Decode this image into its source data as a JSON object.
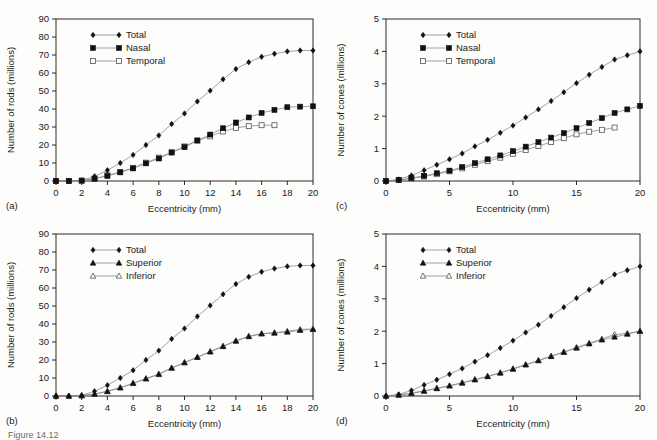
{
  "figure": {
    "background_color": "#fdfdfb",
    "ink_color": "#111111",
    "line_color": "#8a8a8a",
    "caption_partial": "Figure 14.12"
  },
  "labels": {
    "panel_a": "(a)",
    "panel_b": "(b)",
    "panel_c": "(c)",
    "panel_d": "(d)",
    "xlabel": "Eccentricity (mm)",
    "ylabel_rods": "Number of rods (millions)",
    "ylabel_cones": "Number of cones (millions)"
  },
  "chart_data": [
    {
      "id": "panel-a",
      "panel": "(a)",
      "type": "line",
      "title": "",
      "xlabel": "Eccentricity (mm)",
      "ylabel": "Number of rods (millions)",
      "xlim": [
        0,
        20
      ],
      "ylim": [
        0,
        90
      ],
      "xticks": [
        0,
        2,
        4,
        6,
        8,
        10,
        12,
        14,
        16,
        18,
        20
      ],
      "yticks": [
        0,
        10,
        20,
        30,
        40,
        50,
        60,
        70,
        80,
        90
      ],
      "grid": false,
      "legend_position": "upper-left",
      "series": [
        {
          "name": "Total",
          "marker": "filled-diamond",
          "x": [
            0,
            1,
            2,
            3,
            4,
            5,
            6,
            7,
            8,
            9,
            10,
            11,
            12,
            13,
            14,
            15,
            16,
            17,
            18,
            19,
            20
          ],
          "values": [
            0,
            0,
            0.3,
            2.6,
            6.0,
            10.0,
            14.5,
            20.0,
            25.3,
            31.7,
            37.5,
            44.2,
            50.2,
            56.5,
            62.2,
            66.0,
            69.0,
            70.7,
            72.0,
            72.5,
            72.5
          ]
        },
        {
          "name": "Nasal",
          "marker": "filled-square",
          "x": [
            0,
            1,
            2,
            3,
            4,
            5,
            6,
            7,
            8,
            9,
            10,
            11,
            12,
            13,
            14,
            15,
            16,
            17,
            18,
            19,
            20
          ],
          "values": [
            0,
            0,
            0.2,
            1.3,
            2.8,
            4.8,
            7.0,
            9.8,
            12.5,
            15.8,
            18.8,
            22.5,
            25.8,
            29.3,
            32.5,
            35.3,
            37.8,
            39.5,
            41.0,
            41.3,
            41.5
          ]
        },
        {
          "name": "Temporal",
          "marker": "open-square",
          "x": [
            0,
            1,
            2,
            3,
            4,
            5,
            6,
            7,
            8,
            9,
            10,
            11,
            12,
            13,
            14,
            15,
            16,
            17
          ],
          "values": [
            0,
            0,
            0.2,
            1.2,
            3.2,
            5.0,
            7.3,
            10.2,
            13.0,
            16.0,
            19.2,
            22.5,
            24.8,
            27.5,
            29.5,
            30.5,
            31.0,
            31.0
          ]
        }
      ]
    },
    {
      "id": "panel-b",
      "panel": "(b)",
      "type": "line",
      "title": "",
      "xlabel": "Eccentricity (mm)",
      "ylabel": "Number of rods (millions)",
      "xlim": [
        0,
        20
      ],
      "ylim": [
        0,
        90
      ],
      "xticks": [
        0,
        2,
        4,
        6,
        8,
        10,
        12,
        14,
        16,
        18,
        20
      ],
      "yticks": [
        0,
        10,
        20,
        30,
        40,
        50,
        60,
        70,
        80,
        90
      ],
      "grid": false,
      "legend_position": "upper-left",
      "series": [
        {
          "name": "Total",
          "marker": "filled-diamond",
          "x": [
            0,
            1,
            2,
            3,
            4,
            5,
            6,
            7,
            8,
            9,
            10,
            11,
            12,
            13,
            14,
            15,
            16,
            17,
            18,
            19,
            20
          ],
          "values": [
            0,
            0,
            0.3,
            2.6,
            6.0,
            10.0,
            14.3,
            20.0,
            25.2,
            31.7,
            37.5,
            44.2,
            50.3,
            56.5,
            62.2,
            66.2,
            69.0,
            70.8,
            72.0,
            72.5,
            72.5
          ]
        },
        {
          "name": "Superior",
          "marker": "filled-triangle",
          "x": [
            0,
            1,
            2,
            3,
            4,
            5,
            6,
            7,
            8,
            9,
            10,
            11,
            12,
            13,
            14,
            15,
            16,
            17,
            18,
            19,
            20
          ],
          "values": [
            0,
            0,
            0.2,
            1.0,
            2.5,
            4.5,
            7.0,
            9.5,
            12.0,
            15.5,
            18.5,
            21.5,
            24.5,
            27.5,
            30.5,
            33.0,
            34.5,
            35.0,
            35.5,
            36.5,
            37.0
          ]
        },
        {
          "name": "Inferior",
          "marker": "open-triangle",
          "x": [
            0,
            1,
            2,
            3,
            4,
            5,
            6,
            7,
            8,
            9,
            10,
            11,
            12,
            13,
            14,
            15,
            16,
            17,
            18,
            19,
            20
          ],
          "values": [
            0,
            0,
            0.2,
            1.1,
            2.7,
            4.7,
            7.1,
            9.7,
            12.2,
            15.6,
            18.6,
            21.6,
            24.7,
            27.7,
            30.7,
            33.2,
            34.7,
            35.2,
            36.0,
            37.0,
            37.2
          ]
        }
      ]
    },
    {
      "id": "panel-c",
      "panel": "(c)",
      "type": "line",
      "title": "",
      "xlabel": "Eccentricity (mm)",
      "ylabel": "Number of cones (millions)",
      "xlim": [
        0,
        20
      ],
      "ylim": [
        0,
        5
      ],
      "xticks": [
        0,
        5,
        10,
        15,
        20
      ],
      "yticks": [
        0,
        1,
        2,
        3,
        4,
        5
      ],
      "grid": false,
      "legend_position": "upper-left",
      "series": [
        {
          "name": "Total",
          "marker": "filled-diamond",
          "x": [
            0,
            1,
            2,
            3,
            4,
            5,
            6,
            7,
            8,
            9,
            10,
            11,
            12,
            13,
            14,
            15,
            16,
            17,
            18,
            19,
            20
          ],
          "values": [
            0,
            0.05,
            0.17,
            0.33,
            0.5,
            0.67,
            0.85,
            1.07,
            1.27,
            1.49,
            1.71,
            1.96,
            2.21,
            2.47,
            2.74,
            3.02,
            3.28,
            3.52,
            3.75,
            3.88,
            4.0
          ]
        },
        {
          "name": "Nasal",
          "marker": "filled-square",
          "x": [
            0,
            1,
            2,
            3,
            4,
            5,
            6,
            7,
            8,
            9,
            10,
            11,
            12,
            13,
            14,
            15,
            16,
            17,
            18,
            19,
            20
          ],
          "values": [
            0,
            0.03,
            0.09,
            0.16,
            0.24,
            0.32,
            0.43,
            0.55,
            0.67,
            0.79,
            0.92,
            1.06,
            1.2,
            1.34,
            1.48,
            1.63,
            1.79,
            1.94,
            2.1,
            2.21,
            2.32
          ]
        },
        {
          "name": "Temporal",
          "marker": "open-square",
          "x": [
            0,
            1,
            2,
            3,
            4,
            5,
            6,
            7,
            8,
            9,
            10,
            11,
            12,
            13,
            14,
            15,
            16,
            17,
            18
          ],
          "values": [
            0,
            0.03,
            0.08,
            0.14,
            0.21,
            0.3,
            0.39,
            0.5,
            0.61,
            0.72,
            0.84,
            0.96,
            1.08,
            1.2,
            1.32,
            1.44,
            1.52,
            1.58,
            1.65
          ]
        }
      ]
    },
    {
      "id": "panel-d",
      "panel": "(d)",
      "type": "line",
      "title": "",
      "xlabel": "Eccentricity (mm)",
      "ylabel": "Number of cones (millions)",
      "xlim": [
        0,
        20
      ],
      "ylim": [
        0,
        5
      ],
      "xticks": [
        0,
        5,
        10,
        15,
        20
      ],
      "yticks": [
        0,
        1,
        2,
        3,
        4,
        5
      ],
      "grid": false,
      "legend_position": "upper-left",
      "series": [
        {
          "name": "Total",
          "marker": "filled-diamond",
          "x": [
            0,
            1,
            2,
            3,
            4,
            5,
            6,
            7,
            8,
            9,
            10,
            11,
            12,
            13,
            14,
            15,
            16,
            17,
            18,
            19,
            20
          ],
          "values": [
            0,
            0.05,
            0.17,
            0.34,
            0.5,
            0.67,
            0.85,
            1.06,
            1.26,
            1.48,
            1.71,
            1.96,
            2.2,
            2.47,
            2.74,
            3.02,
            3.28,
            3.52,
            3.75,
            3.88,
            4.0
          ]
        },
        {
          "name": "Superior",
          "marker": "filled-triangle",
          "x": [
            0,
            1,
            2,
            3,
            4,
            5,
            6,
            7,
            8,
            9,
            10,
            11,
            12,
            13,
            14,
            15,
            16,
            17,
            18,
            19,
            20
          ],
          "values": [
            0,
            0.03,
            0.08,
            0.15,
            0.23,
            0.31,
            0.4,
            0.5,
            0.6,
            0.71,
            0.83,
            0.96,
            1.09,
            1.22,
            1.35,
            1.48,
            1.61,
            1.73,
            1.82,
            1.91,
            2.0
          ]
        },
        {
          "name": "Inferior",
          "marker": "open-triangle",
          "x": [
            0,
            1,
            2,
            3,
            4,
            5,
            6,
            7,
            8,
            9,
            10,
            11,
            12,
            13,
            14,
            15,
            16,
            17,
            18,
            19,
            20
          ],
          "values": [
            0,
            0.03,
            0.09,
            0.16,
            0.24,
            0.32,
            0.41,
            0.51,
            0.61,
            0.72,
            0.84,
            0.97,
            1.1,
            1.23,
            1.36,
            1.5,
            1.63,
            1.76,
            1.9,
            1.93,
            2.0
          ]
        }
      ]
    }
  ]
}
